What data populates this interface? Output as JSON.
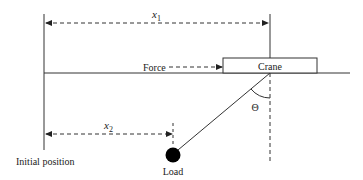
{
  "diagram": {
    "labels": {
      "x1": "x",
      "x1_sub": "1",
      "x2": "x",
      "x2_sub": "2",
      "force": "Force",
      "crane": "Crane",
      "theta": "Θ",
      "load": "Load",
      "initial_position": "Initial position"
    },
    "colors": {
      "line": "#333333",
      "load_fill": "#000000"
    }
  }
}
